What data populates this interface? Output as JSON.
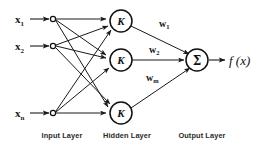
{
  "diagram": {
    "type": "neural-network-diagram",
    "background_color": "#ffffff",
    "stroke_color": "#1a1a1a"
  },
  "input_layer": {
    "caption": "Input Layer",
    "caption_x": 62,
    "caption_y": 138,
    "nodes": [
      {
        "id": "x1",
        "base": "x",
        "subscript": "1",
        "cx": 53,
        "cy": 19,
        "r": 2.6,
        "label_x": 15,
        "label_y": 23
      },
      {
        "id": "x2",
        "base": "x",
        "subscript": "2",
        "cx": 53,
        "cy": 46,
        "r": 2.6,
        "label_x": 15,
        "label_y": 50
      },
      {
        "id": "xn",
        "base": "x",
        "subscript": "n",
        "cx": 53,
        "cy": 113,
        "r": 2.6,
        "label_x": 15,
        "label_y": 117
      }
    ]
  },
  "hidden_layer": {
    "caption": "Hidden Layer",
    "caption_x": 127,
    "caption_y": 138,
    "nodes": [
      {
        "id": "k1",
        "glyph": "K",
        "cx": 121,
        "cy": 21,
        "r": 11
      },
      {
        "id": "k2",
        "glyph": "K",
        "cx": 121,
        "cy": 60,
        "r": 11
      },
      {
        "id": "k3",
        "glyph": "K",
        "cx": 121,
        "cy": 113,
        "r": 11
      }
    ]
  },
  "output_layer": {
    "caption": "Output Layer",
    "caption_x": 202,
    "caption_y": 138,
    "node": {
      "id": "sum",
      "glyph": "Σ",
      "cx": 197,
      "cy": 60,
      "r": 11
    },
    "output_label": {
      "text": "f (x)",
      "x": 229,
      "y": 65
    }
  },
  "weights": [
    {
      "id": "w1",
      "base": "w",
      "subscript": "1",
      "x": 159,
      "y": 27
    },
    {
      "id": "w2",
      "base": "w",
      "subscript": "2",
      "x": 149,
      "y": 53
    },
    {
      "id": "wm",
      "base": "w",
      "subscript": "m",
      "x": 146,
      "y": 81
    }
  ],
  "connections": {
    "input_to_hidden_count": 9,
    "hidden_to_output_count": 3,
    "arrowheads": true
  }
}
